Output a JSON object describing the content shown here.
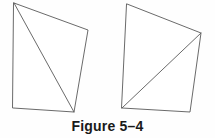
{
  "figure": {
    "caption": "Figure 5–4",
    "background_color": "#fefefe",
    "line_color": "#595959",
    "fill_color": "#ffffff",
    "caption_color": "#1a1a1a",
    "shapes": [
      {
        "id": "left-quadrilateral",
        "name": "left-quadrilateral",
        "outline_points": "14,3 88,30 74,112 13,108",
        "diagonal_points": "14,3 74,112",
        "diagonal_description": "top-left vertex to bottom-right vertex"
      },
      {
        "id": "right-quadrilateral",
        "name": "right-quadrilateral",
        "outline_points": "127,4 201,33 190,112 122,108",
        "diagonal_points": "122,108 201,33",
        "diagonal_description": "bottom-left vertex to right vertex"
      }
    ]
  }
}
